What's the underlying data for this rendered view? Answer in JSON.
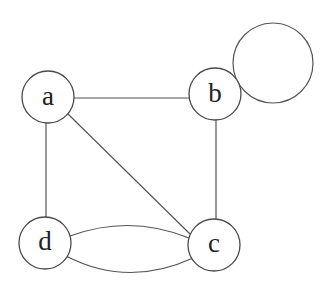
{
  "diagram": {
    "type": "undirected-multigraph",
    "nodes": [
      {
        "id": "a",
        "label": "a"
      },
      {
        "id": "b",
        "label": "b"
      },
      {
        "id": "c",
        "label": "c"
      },
      {
        "id": "d",
        "label": "d"
      }
    ],
    "edges": [
      {
        "from": "a",
        "to": "b"
      },
      {
        "from": "a",
        "to": "d"
      },
      {
        "from": "a",
        "to": "c"
      },
      {
        "from": "b",
        "to": "c"
      },
      {
        "from": "d",
        "to": "c",
        "curve": "upper"
      },
      {
        "from": "d",
        "to": "c",
        "curve": "lower"
      },
      {
        "from": "b",
        "to": "b",
        "type": "self-loop"
      }
    ]
  }
}
